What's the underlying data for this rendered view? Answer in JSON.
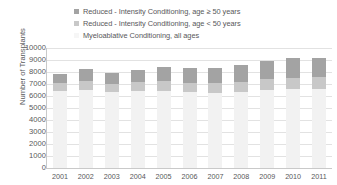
{
  "chart_data": {
    "type": "bar",
    "subtype": "stacked-vertical",
    "title": "",
    "xlabel": "",
    "ylabel": "Number of Transplants",
    "ylim": [
      0,
      10000
    ],
    "ytick_step": 1000,
    "ytick_labels": [
      "10000",
      "9000",
      "8000",
      "7000",
      "6000",
      "5000",
      "4000",
      "3000",
      "2000",
      "1000",
      "0"
    ],
    "grid": true,
    "legend_position": "top",
    "categories": [
      "2001",
      "2002",
      "2003",
      "2004",
      "2005",
      "2006",
      "2007",
      "2008",
      "2009",
      "2010",
      "2011"
    ],
    "series": [
      {
        "name": "Myeloablative Conditioning, all ages",
        "color": "#f2f2f2",
        "marker": "square",
        "values": [
          6450,
          6500,
          6300,
          6400,
          6450,
          6300,
          6250,
          6300,
          6500,
          6550,
          6600
        ]
      },
      {
        "name": "Reduced-Intensity Conditioning, age < 50 years",
        "color": "#c8c8c8",
        "marker": "square",
        "values": [
          600,
          750,
          700,
          750,
          800,
          800,
          800,
          850,
          900,
          950,
          950
        ]
      },
      {
        "name": "Reduced-Intensity Conditioning, age ≥ 50 years",
        "color": "#a3a3a3",
        "marker": "square",
        "values": [
          750,
          1000,
          900,
          1050,
          1150,
          1200,
          1250,
          1400,
          1550,
          1700,
          1650
        ]
      }
    ],
    "totals": [
      7800,
      8250,
      7900,
      8200,
      8400,
      8300,
      8300,
      8550,
      8950,
      9200,
      9200
    ]
  },
  "legend": {
    "items": [
      {
        "label": "Reduced - Intensity Conditioning, age ≥ 50 years",
        "color": "#a3a3a3"
      },
      {
        "label": "Reduced - Intensity Conditioning, age < 50 years",
        "color": "#c8c8c8"
      },
      {
        "label": "Myeloablative Conditioning, all ages",
        "color": "#f6f6f6"
      }
    ]
  },
  "axes": {
    "y_title": "Number of Transplants"
  },
  "colors": {
    "grid": "#e2e2e2",
    "axis": "#c9c9c9",
    "text": "#58585a",
    "background": "#ffffff"
  }
}
